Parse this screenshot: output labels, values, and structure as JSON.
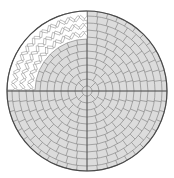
{
  "diagram": {
    "center": [
      87,
      91
    ],
    "outer_radius": 80,
    "inner_quadrant_radius": 52,
    "colors": {
      "fill": "#dcdcdc",
      "line": "#7a7a7a",
      "outer_edge": "#4a4a4a",
      "quadrant_fill": "#ffffff",
      "herringbone": "#8a8a8a"
    },
    "rings": [
      {
        "r": 5,
        "segments": 1
      },
      {
        "r": 12,
        "segments": 8
      },
      {
        "r": 19,
        "segments": 12
      },
      {
        "r": 26,
        "segments": 16
      },
      {
        "r": 33,
        "segments": 20
      },
      {
        "r": 40,
        "segments": 24
      },
      {
        "r": 47,
        "segments": 28
      },
      {
        "r": 54,
        "segments": 32
      },
      {
        "r": 61,
        "segments": 36
      },
      {
        "r": 68,
        "segments": 40
      },
      {
        "r": 75,
        "segments": 44
      },
      {
        "r": 80,
        "segments": 48
      }
    ],
    "cutout_quadrant": "top-left",
    "cutout_pattern": "herringbone"
  }
}
